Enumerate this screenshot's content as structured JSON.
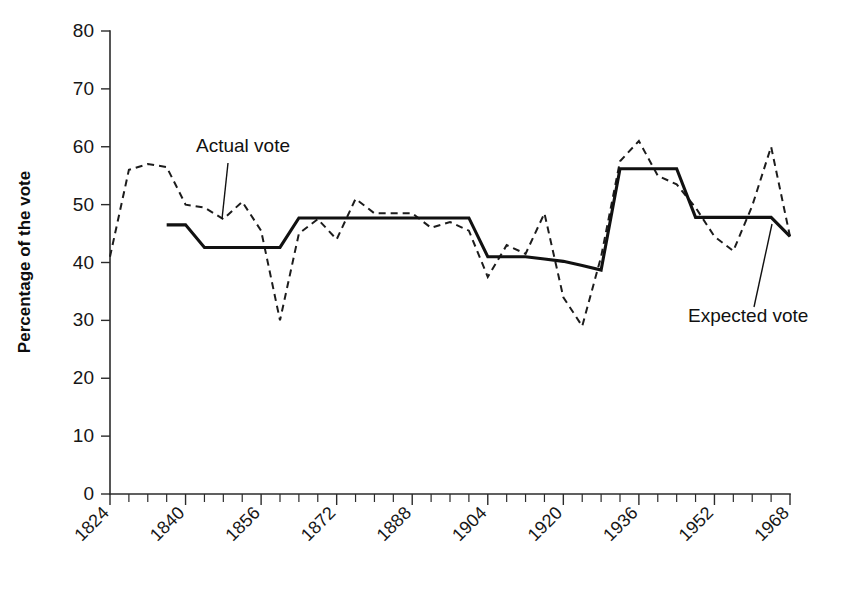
{
  "chart_data": {
    "type": "line",
    "title": "",
    "xlabel": "",
    "ylabel": "Percentage of the vote",
    "xlim": [
      1824,
      1968
    ],
    "ylim": [
      0,
      80
    ],
    "grid": false,
    "legend_position": "inline-annotations",
    "x_tick_step": 4,
    "x_label_step": 16,
    "y_tick_step": 10,
    "xticklabels": [
      "1824",
      "1840",
      "1856",
      "1872",
      "1888",
      "1904",
      "1920",
      "1936",
      "1952",
      "1968"
    ],
    "yticklabels": [
      "0",
      "10",
      "20",
      "30",
      "40",
      "50",
      "60",
      "70",
      "80"
    ],
    "series": [
      {
        "name": "Actual vote",
        "style": "dashed",
        "x": [
          1824,
          1828,
          1832,
          1836,
          1840,
          1844,
          1848,
          1852,
          1856,
          1860,
          1864,
          1868,
          1872,
          1876,
          1880,
          1884,
          1888,
          1892,
          1896,
          1900,
          1904,
          1908,
          1912,
          1916,
          1920,
          1924,
          1928,
          1932,
          1936,
          1940,
          1944,
          1948,
          1952,
          1956,
          1960,
          1964,
          1968
        ],
        "values": [
          41.0,
          56.0,
          57.0,
          56.5,
          50.0,
          49.5,
          47.5,
          50.5,
          45.5,
          30.0,
          45.0,
          47.5,
          44.0,
          51.0,
          48.5,
          48.5,
          48.5,
          46.0,
          47.0,
          45.5,
          37.5,
          43.0,
          41.5,
          48.5,
          34.0,
          29.0,
          41.0,
          57.5,
          61.0,
          55.0,
          53.5,
          49.5,
          44.5,
          42.0,
          49.8,
          60.0,
          44.5
        ]
      },
      {
        "name": "Expected vote",
        "style": "solid",
        "x": [
          1836,
          1840,
          1844,
          1848,
          1852,
          1856,
          1860,
          1864,
          1868,
          1872,
          1876,
          1880,
          1884,
          1888,
          1892,
          1896,
          1900,
          1904,
          1908,
          1912,
          1916,
          1920,
          1924,
          1928,
          1932,
          1936,
          1940,
          1944,
          1948,
          1952,
          1956,
          1960,
          1964,
          1968
        ],
        "values": [
          46.5,
          46.5,
          42.6,
          42.6,
          42.6,
          42.6,
          42.6,
          47.7,
          47.7,
          47.7,
          47.7,
          47.7,
          47.7,
          47.7,
          47.7,
          47.7,
          47.7,
          41.0,
          41.0,
          41.0,
          40.6,
          40.2,
          39.5,
          38.7,
          56.2,
          56.2,
          56.2,
          56.2,
          47.8,
          47.8,
          47.8,
          47.8,
          47.8,
          44.5
        ]
      }
    ],
    "annotations": [
      {
        "text": "Actual vote",
        "label_x": 196,
        "label_y": 152,
        "leader": [
          [
            228,
            163
          ],
          [
            222,
            219
          ]
        ]
      },
      {
        "text": "Expected vote",
        "label_x": 688,
        "label_y": 322,
        "leader": [
          [
            754,
            307
          ],
          [
            772,
            224
          ]
        ]
      }
    ]
  },
  "geometry": {
    "plot_left": 110,
    "plot_right": 790,
    "plot_top": 31,
    "plot_bottom": 494
  }
}
